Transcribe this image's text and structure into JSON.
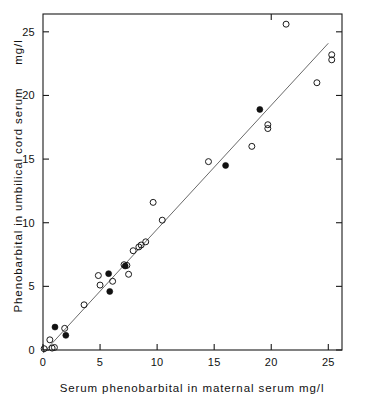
{
  "chart_data": {
    "type": "scatter",
    "title": "",
    "xlabel": "Serum phenobarbital in maternal serum  mg/l",
    "ylabel": "Phenobarbital in umbilical cord serum",
    "ylabel_units": "mg/l",
    "xlim": [
      0,
      26.2
    ],
    "ylim": [
      0,
      26.4
    ],
    "xticks": [
      0,
      5,
      10,
      15,
      20,
      25
    ],
    "yticks": [
      0,
      5,
      10,
      15,
      20,
      25
    ],
    "xticklabels": [
      "0",
      "5",
      "10",
      "15",
      "20",
      "25"
    ],
    "yticklabels": [
      "0",
      "5",
      "10",
      "15",
      "20",
      "25"
    ],
    "grid": false,
    "legend": "none",
    "frame": "box",
    "tick_direction": "in",
    "series": [
      {
        "name": "open-circles",
        "marker": "open-circle",
        "color": "#1a1a1a",
        "points": [
          [
            0.1,
            0.1
          ],
          [
            0.6,
            0.8
          ],
          [
            0.8,
            0.15
          ],
          [
            1.0,
            0.2
          ],
          [
            1.9,
            1.7
          ],
          [
            3.6,
            3.55
          ],
          [
            4.85,
            5.85
          ],
          [
            5.0,
            5.1
          ],
          [
            6.1,
            5.4
          ],
          [
            7.1,
            6.7
          ],
          [
            7.35,
            6.65
          ],
          [
            7.5,
            5.95
          ],
          [
            7.9,
            7.8
          ],
          [
            8.4,
            8.1
          ],
          [
            8.6,
            8.25
          ],
          [
            9.0,
            8.5
          ],
          [
            9.65,
            11.6
          ],
          [
            10.45,
            10.2
          ],
          [
            14.5,
            14.8
          ],
          [
            18.3,
            16.0
          ],
          [
            19.7,
            17.7
          ],
          [
            19.7,
            17.4
          ],
          [
            21.3,
            25.6
          ],
          [
            24.0,
            21.0
          ],
          [
            25.3,
            23.2
          ],
          [
            25.3,
            22.8
          ]
        ]
      },
      {
        "name": "filled-circles",
        "marker": "filled-circle",
        "color": "#111111",
        "points": [
          [
            1.05,
            1.8
          ],
          [
            2.0,
            1.15
          ],
          [
            5.75,
            6.0
          ],
          [
            5.85,
            4.6
          ],
          [
            7.2,
            6.6
          ],
          [
            16.0,
            14.5
          ],
          [
            19.0,
            18.9
          ]
        ]
      }
    ],
    "trend_line": {
      "name": "regression-line",
      "x1": 0.0,
      "y1": -0.25,
      "x2": 25.0,
      "y2": 24.1,
      "color": "#6a6a6a"
    }
  }
}
